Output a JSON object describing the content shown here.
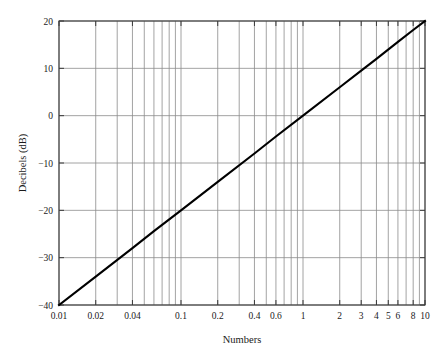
{
  "chart_data": {
    "type": "line",
    "title": "",
    "xlabel": "Numbers",
    "ylabel": "Decibels (dB)",
    "xscale": "log",
    "yscale": "linear",
    "xlim": [
      0.01,
      10
    ],
    "ylim": [
      -40,
      20
    ],
    "grid": true,
    "legend": null,
    "x_tick_labels": [
      "0.01",
      "0.02",
      "0.04",
      "0.1",
      "0.2",
      "0.4",
      "0.6",
      "1",
      "2",
      "3",
      "4",
      "5",
      "6",
      "8",
      "10"
    ],
    "x_tick_values": [
      0.01,
      0.02,
      0.04,
      0.1,
      0.2,
      0.4,
      0.6,
      1,
      2,
      3,
      4,
      5,
      6,
      8,
      10
    ],
    "y_tick_labels": [
      "20",
      "10",
      "0",
      "−10",
      "−20",
      "−30",
      "−40"
    ],
    "y_tick_values": [
      20,
      10,
      0,
      -10,
      -20,
      -30,
      -40
    ],
    "x_gridlines": [
      0.01,
      0.02,
      0.03,
      0.04,
      0.05,
      0.06,
      0.07,
      0.08,
      0.09,
      0.1,
      0.2,
      0.3,
      0.4,
      0.5,
      0.6,
      0.7,
      0.8,
      0.9,
      1,
      2,
      3,
      4,
      5,
      6,
      7,
      8,
      9,
      10
    ],
    "y_gridlines": [
      20,
      10,
      0,
      -10,
      -20,
      -30,
      -40
    ],
    "series": [
      {
        "name": "Decibels vs Numbers",
        "relation": "dB = 20 log10(Numbers)",
        "color": "#000000",
        "x": [
          0.01,
          0.02,
          0.04,
          0.06,
          0.1,
          0.2,
          0.4,
          0.6,
          1,
          2,
          3,
          4,
          6,
          8,
          10
        ],
        "values": [
          -40,
          -34,
          -28,
          -24.4,
          -20,
          -14,
          -8,
          -4.4,
          0,
          6,
          9.5,
          12,
          15.6,
          18.1,
          20
        ]
      }
    ],
    "annotations": []
  },
  "axis_label_color": "#1a1a1a",
  "grid_color": "#8c8c8c",
  "frame_color": "#3a3a3a",
  "line_color": "#000000",
  "background": "#ffffff"
}
